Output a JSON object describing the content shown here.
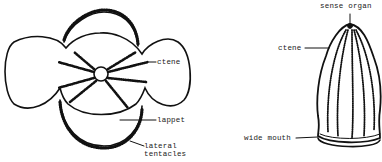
{
  "diagram": {
    "panels": [
      {
        "id": "left",
        "view": "aboral/top view with lobes",
        "labels": [
          {
            "text": "ctene"
          },
          {
            "text": "lappet"
          },
          {
            "text": "lateral\ntentacles"
          }
        ]
      },
      {
        "id": "right",
        "view": "side view, bell-shaped body",
        "labels": [
          {
            "text": "sense organ"
          },
          {
            "text": "ctene"
          },
          {
            "text": "wide mouth"
          }
        ]
      }
    ],
    "colors": {
      "ink": "#111111",
      "background": "#ffffff"
    }
  }
}
